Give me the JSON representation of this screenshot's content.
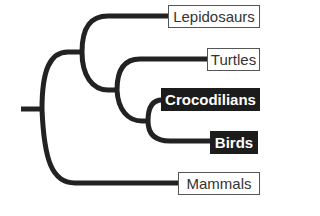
{
  "diagram": {
    "type": "cladogram",
    "line_color": "#222222",
    "taxa": [
      {
        "name": "Lepidosaurs",
        "highlighted": false
      },
      {
        "name": "Turtles",
        "highlighted": false
      },
      {
        "name": "Crocodilians",
        "highlighted": true
      },
      {
        "name": "Birds",
        "highlighted": true
      },
      {
        "name": "Mammals",
        "highlighted": false
      }
    ],
    "structure": "(Mammals, (Lepidosaurs, (Turtles, (Crocodilians, Birds))))"
  }
}
